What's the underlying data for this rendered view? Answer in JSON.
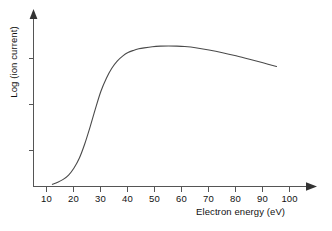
{
  "chart_data": {
    "type": "line",
    "title": "",
    "xlabel": "Electron energy (eV)",
    "ylabel": "Log (ion current)",
    "xlim": [
      0,
      108
    ],
    "ylim": [
      0,
      1.05
    ],
    "grid": false,
    "legend": null,
    "x_ticks": [
      "10",
      "20",
      "30",
      "40",
      "50",
      "60",
      "70",
      "80",
      "90",
      "100"
    ],
    "x_tick_values": [
      10,
      20,
      30,
      40,
      50,
      60,
      70,
      80,
      90,
      100
    ],
    "y_ticks": [
      "",
      "",
      ""
    ],
    "y_tick_values": [
      0.25,
      0.5,
      0.78
    ],
    "series": [
      {
        "name": "Ionization efficiency",
        "x": [
          7,
          9,
          11,
          13,
          15,
          17,
          19,
          21,
          23,
          25,
          27,
          29,
          31,
          33,
          35,
          37,
          39,
          41,
          44,
          47,
          50,
          53,
          56,
          60,
          65,
          70,
          75,
          80,
          85,
          90
        ],
        "y": [
          0.015,
          0.03,
          0.05,
          0.08,
          0.13,
          0.2,
          0.3,
          0.42,
          0.55,
          0.67,
          0.76,
          0.83,
          0.88,
          0.915,
          0.94,
          0.955,
          0.966,
          0.973,
          0.981,
          0.985,
          0.986,
          0.985,
          0.982,
          0.974,
          0.958,
          0.939,
          0.917,
          0.893,
          0.868,
          0.842
        ]
      }
    ],
    "annotations": [],
    "axis_style": {
      "x_axis_arrow": true,
      "y_axis_arrow": true,
      "spines": [
        "left",
        "bottom"
      ],
      "line_color": "#4a4a4a",
      "axis_color": "#555555",
      "background": "#ffffff"
    }
  }
}
